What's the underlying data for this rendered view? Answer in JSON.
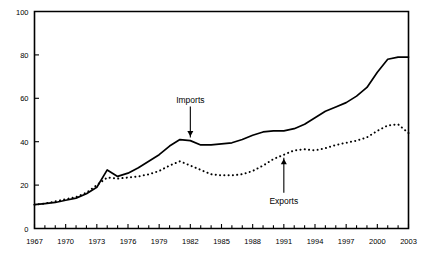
{
  "chart_data": {
    "type": "line",
    "title": "",
    "subtitle": "",
    "xlabel": "",
    "ylabel": "",
    "xlim": [
      1967,
      2003
    ],
    "ylim": [
      0,
      100
    ],
    "grid": false,
    "legend_position": "none",
    "x_tick_labels": [
      "1967",
      "1970",
      "1973",
      "1976",
      "1979",
      "1982",
      "1985",
      "1988",
      "1991",
      "1994",
      "1997",
      "2000",
      "2003"
    ],
    "x_tick_values": [
      1967,
      1970,
      1973,
      1976,
      1979,
      1982,
      1985,
      1988,
      1991,
      1994,
      1997,
      2000,
      2003
    ],
    "x_minor_tick_interval": 1,
    "y_tick_labels": [
      "0",
      "20",
      "40",
      "60",
      "80",
      "100"
    ],
    "y_tick_values": [
      0,
      20,
      40,
      60,
      80,
      100
    ],
    "x": [
      1967,
      1968,
      1969,
      1970,
      1971,
      1972,
      1973,
      1974,
      1975,
      1976,
      1977,
      1978,
      1979,
      1980,
      1981,
      1982,
      1983,
      1984,
      1985,
      1986,
      1987,
      1988,
      1989,
      1990,
      1991,
      1992,
      1993,
      1994,
      1995,
      1996,
      1997,
      1998,
      1999,
      2000,
      2001,
      2002,
      2003
    ],
    "series": [
      {
        "name": "Imports",
        "style": "solid",
        "color": "#000000",
        "values": [
          11,
          11.5,
          12,
          13,
          14,
          16,
          19,
          27,
          24,
          25.5,
          28,
          31,
          34,
          38,
          41,
          40.5,
          38.5,
          38.5,
          39,
          39.5,
          41,
          43,
          44.5,
          45,
          45,
          46,
          48,
          51,
          54,
          56,
          58,
          61,
          65,
          72,
          78,
          79,
          79
        ]
      },
      {
        "name": "Exports",
        "style": "dotted",
        "color": "#000000",
        "values": [
          11,
          11.5,
          12.5,
          13.5,
          14.5,
          16.5,
          20,
          23.5,
          23,
          23.5,
          24,
          25,
          26.5,
          29,
          31,
          29,
          27,
          25,
          24.5,
          24.5,
          25,
          26.5,
          29,
          32,
          34,
          36,
          36.5,
          36,
          37,
          38.5,
          39.5,
          40.5,
          42,
          45,
          47.5,
          48,
          44
        ]
      }
    ],
    "annotations": [
      {
        "text": "Imports",
        "target_series": "Imports",
        "target_x": 1982,
        "arrow_direction": "down"
      },
      {
        "text": "Exports",
        "target_series": "Exports",
        "target_x": 1991,
        "arrow_direction": "up"
      }
    ]
  }
}
